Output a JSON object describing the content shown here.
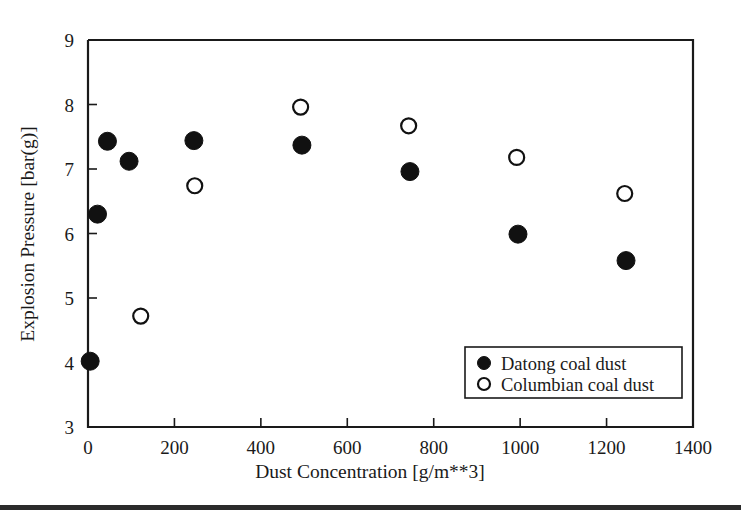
{
  "chart_data": {
    "type": "scatter",
    "title": "",
    "xlabel": "Dust Concentration [g/m**3]",
    "ylabel": "Explosion Pressure [bar(g)]",
    "xlim": [
      0,
      1400
    ],
    "ylim": [
      3,
      9
    ],
    "xticks": [
      0,
      200,
      400,
      600,
      800,
      1000,
      1200,
      1400
    ],
    "yticks": [
      3,
      4,
      5,
      6,
      7,
      8,
      9
    ],
    "xticklabels": [
      "0",
      "200",
      "400",
      "600",
      "800",
      "1000",
      "1200",
      "1400"
    ],
    "yticklabels": [
      "3",
      "4",
      "5",
      "6",
      "7",
      "8",
      "9"
    ],
    "grid": false,
    "legend_position": "lower right",
    "series": [
      {
        "name": "Datong coal dust",
        "marker": "filled-circle",
        "color": "#111111",
        "points": [
          {
            "x": 5,
            "y": 4.02
          },
          {
            "x": 22,
            "y": 6.3
          },
          {
            "x": 45,
            "y": 7.43
          },
          {
            "x": 95,
            "y": 7.12
          },
          {
            "x": 245,
            "y": 7.44
          },
          {
            "x": 495,
            "y": 7.37
          },
          {
            "x": 745,
            "y": 6.96
          },
          {
            "x": 995,
            "y": 5.99
          },
          {
            "x": 1245,
            "y": 5.58
          }
        ]
      },
      {
        "name": "Columbian coal dust",
        "marker": "open-circle",
        "color": "#111111",
        "points": [
          {
            "x": 122,
            "y": 4.72
          },
          {
            "x": 247,
            "y": 6.74
          },
          {
            "x": 492,
            "y": 7.96
          },
          {
            "x": 742,
            "y": 7.67
          },
          {
            "x": 992,
            "y": 7.18
          },
          {
            "x": 1242,
            "y": 6.62
          }
        ]
      }
    ]
  },
  "legend": {
    "entries": [
      {
        "label": "Datong coal dust",
        "marker": "filled-circle"
      },
      {
        "label": "Columbian coal dust",
        "marker": "open-circle"
      }
    ]
  }
}
